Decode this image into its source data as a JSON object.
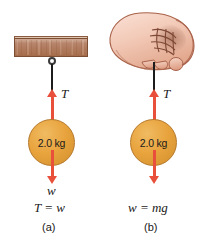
{
  "figure": {
    "background_color": "#ffffff",
    "accent_arrow_color": "#e8503c",
    "mass_fill_color": "#e8a33d",
    "mass_border_color": "#b5782a",
    "beam_color": "#b07a5f",
    "string_color": "#1c1c1c",
    "skin_color": "#f5cfc0"
  },
  "panel_a": {
    "caption": "(a)",
    "support": "ceiling-beam",
    "mass_label": "2.0 kg",
    "tension_label": "T",
    "weight_label": "w",
    "equation": "T = w"
  },
  "panel_b": {
    "caption": "(b)",
    "support": "hand",
    "mass_label": "2.0 kg",
    "tension_label": "T",
    "equation": "w = mg"
  }
}
